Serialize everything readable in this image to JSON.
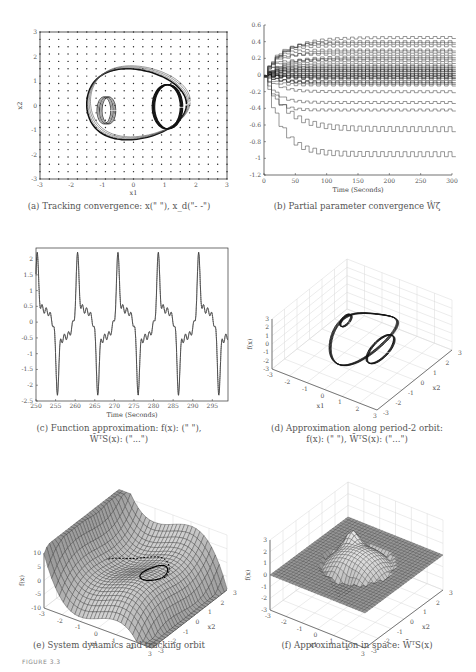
{
  "figure": {
    "label": "FIGURE 3.3"
  },
  "panels": {
    "a": {
      "caption": "(a) Tracking convergence: x(\"  \"), x_d(\"- -\")",
      "xlabel": "x1",
      "ylabel": "x2",
      "xticks": [
        "-3",
        "-2",
        "-1",
        "0",
        "1",
        "2",
        "3"
      ],
      "yticks": [
        "3",
        "2",
        "1",
        "0",
        "-1",
        "-2",
        "-3"
      ]
    },
    "b": {
      "caption": "(b) Partial parameter convergence Ŵζ",
      "xlabel": "Time (Seconds)",
      "xticks": [
        "0",
        "50",
        "100",
        "150",
        "200",
        "250",
        "300"
      ],
      "yticks": [
        "0.6",
        "0.4",
        "0.2",
        "0",
        "-0.2",
        "-0.4",
        "-0.6",
        "-0.8",
        "-1",
        "-1.2"
      ]
    },
    "c": {
      "caption_line1": "(c) Function approximation: f(x): (\"  \"),",
      "caption_line2": "W̄ᵀS(x): (\"...\")",
      "xlabel": "Time (Seconds)",
      "xticks": [
        "250",
        "255",
        "260",
        "265",
        "270",
        "275",
        "280",
        "285",
        "290",
        "295"
      ],
      "yticks": [
        "2",
        "1.5",
        "1",
        "0.5",
        "0",
        "-0.5",
        "-1",
        "-1.5",
        "-2",
        "-2.5"
      ]
    },
    "d": {
      "caption_line1": "(d) Approximation along period-2 orbit:",
      "caption_line2": "f(x): (\"  \"), W̄ᵀS(x): (\"...\")",
      "xlabel": "x1",
      "ylabel": "x2",
      "zlabel": "f(x)",
      "zticks": [
        "3",
        "2",
        "1",
        "0",
        "-1",
        "-2",
        "-3"
      ],
      "x1ticks": [
        "-3",
        "-2",
        "-1",
        "0",
        "1",
        "2",
        "3"
      ],
      "x2ticks": [
        "-3",
        "-2",
        "-1",
        "0",
        "1",
        "2",
        "3"
      ]
    },
    "e": {
      "caption": "(e) System dynamics and tracking orbit",
      "xlabel": "x1",
      "ylabel": "x2",
      "zlabel": "f(x)",
      "zticks": [
        "10",
        "5",
        "0",
        "-5",
        "-10"
      ],
      "x1ticks": [
        "-3",
        "-2",
        "-1",
        "0",
        "1",
        "2",
        "3"
      ],
      "x2ticks": [
        "-3",
        "-2",
        "-1",
        "0",
        "1",
        "2",
        "3"
      ]
    },
    "f": {
      "caption": "(f) Approximation in space: W̄ᵀS(x)",
      "xlabel": "x1",
      "ylabel": "x2",
      "zlabel": "f(x)",
      "zticks": [
        "3",
        "2",
        "1",
        "0",
        "-1",
        "-2",
        "-3"
      ],
      "x1ticks": [
        "-3",
        "-2",
        "-1",
        "0",
        "1",
        "2",
        "3"
      ],
      "x2ticks": [
        "-3",
        "-2",
        "-1",
        "0",
        "1",
        "2",
        "3"
      ]
    }
  },
  "chart_data": [
    {
      "id": "a",
      "type": "line",
      "title": "Tracking convergence",
      "xlabel": "x1",
      "ylabel": "x2",
      "xlim": [
        -3,
        3
      ],
      "ylim": [
        -3,
        3
      ],
      "grid": "dot-lattice (RBF centers) spacing 0.3",
      "series": [
        {
          "name": "x (actual)",
          "description": "period-2 orbit, outer loop x1∈[-1.7,1.6], x2∈[-1.4,1.5], inner loops near (-1,0) and (1,0)"
        },
        {
          "name": "x_d (reference)",
          "description": "same orbit, dashed"
        }
      ]
    },
    {
      "id": "b",
      "type": "line",
      "title": "Partial parameter convergence",
      "xlabel": "Time (Seconds)",
      "ylabel": "",
      "xlim": [
        0,
        300
      ],
      "ylim": [
        -1.2,
        0.6
      ],
      "series_summary": "many neural weight trajectories converging; final values range approx -0.95 to 0.45",
      "final_values_sample": [
        0.45,
        0.4,
        0.35,
        0.3,
        0.25,
        0.2,
        0.15,
        0.1,
        0.05,
        0.0,
        -0.05,
        -0.1,
        -0.2,
        -0.33,
        -0.42,
        -0.65,
        -0.95
      ]
    },
    {
      "id": "c",
      "type": "line",
      "title": "Function approximation",
      "xlabel": "Time (Seconds)",
      "ylabel": "",
      "xlim": [
        250,
        299
      ],
      "ylim": [
        -2.5,
        2.3
      ],
      "period_seconds": 10.3,
      "series": [
        {
          "name": "f(x)",
          "style": "solid"
        },
        {
          "name": "W^T S(x)",
          "style": "dotted"
        }
      ],
      "peaks": [
        {
          "t": 250.3,
          "y": 2.2
        },
        {
          "t": 260.6,
          "y": 2.2
        },
        {
          "t": 270.9,
          "y": 2.2
        },
        {
          "t": 281.2,
          "y": 2.2
        },
        {
          "t": 291.5,
          "y": 2.2
        }
      ],
      "troughs": [
        {
          "t": 256.0,
          "y": -2.05
        },
        {
          "t": 266.3,
          "y": -2.05
        },
        {
          "t": 276.6,
          "y": -2.05
        },
        {
          "t": 286.9,
          "y": -2.05
        },
        {
          "t": 297.2,
          "y": -2.05
        }
      ]
    },
    {
      "id": "d",
      "type": "line",
      "title": "Approximation along period-2 orbit (3D)",
      "xlabel": "x1",
      "ylabel": "x2",
      "zlabel": "f(x)",
      "xlim": [
        -3,
        3
      ],
      "ylim": [
        -3,
        3
      ],
      "zlim": [
        -3,
        3
      ]
    },
    {
      "id": "e",
      "type": "surface",
      "title": "System dynamics and tracking orbit",
      "xlabel": "x1",
      "ylabel": "x2",
      "zlabel": "f(x)",
      "xlim": [
        -3,
        3
      ],
      "ylim": [
        -3,
        3
      ],
      "zlim": [
        -10,
        10
      ]
    },
    {
      "id": "f",
      "type": "surface",
      "title": "Approximation in space",
      "xlabel": "x1",
      "ylabel": "x2",
      "zlabel": "f(x)",
      "xlim": [
        -3,
        3
      ],
      "ylim": [
        -3,
        3
      ],
      "zlim": [
        -3,
        3
      ]
    }
  ]
}
